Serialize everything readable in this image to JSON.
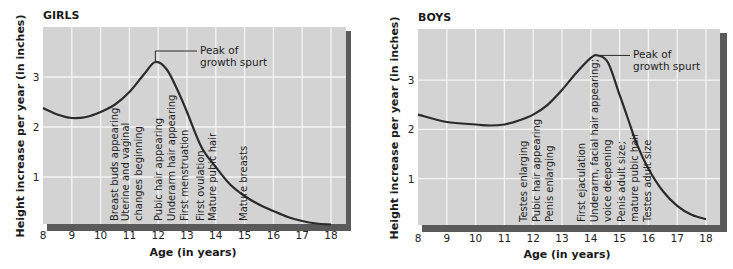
{
  "chart_data": [
    {
      "type": "line",
      "title": "GIRLS",
      "xlabel": "Age (in years)",
      "ylabel": "Height increase per year (in inches)",
      "xlim": [
        8,
        18
      ],
      "ylim": [
        0,
        3.9
      ],
      "xticks": [
        "8",
        "9",
        "10",
        "11",
        "12",
        "13",
        "14",
        "15",
        "16",
        "17",
        "18"
      ],
      "yticks": [
        "1",
        "2",
        "3"
      ],
      "grid": true,
      "x": [
        8,
        8.5,
        9,
        9.5,
        10,
        10.5,
        11,
        11.5,
        11.9,
        12.3,
        12.7,
        13,
        13.5,
        14,
        14.5,
        15,
        15.5,
        16,
        16.5,
        17,
        17.5,
        18
      ],
      "values": [
        2.38,
        2.25,
        2.18,
        2.2,
        2.3,
        2.45,
        2.7,
        3.05,
        3.3,
        3.15,
        2.7,
        2.3,
        1.6,
        1.2,
        0.85,
        0.62,
        0.45,
        0.32,
        0.2,
        0.12,
        0.07,
        0.05
      ],
      "annotations": {
        "peak": [
          "Peak of",
          "growth spurt"
        ],
        "peak_x": 11.9,
        "peak_y": 3.3,
        "events": [
          {
            "x": 10.45,
            "label": "Breast buds appearing"
          },
          {
            "x": 10.85,
            "label": "Uterine and vaginal"
          },
          {
            "x": 11.3,
            "label": "changes beginning"
          },
          {
            "x": 12.0,
            "label": "Pubic hair appearing"
          },
          {
            "x": 12.45,
            "label": "Underarm hair appearing"
          },
          {
            "x": 12.9,
            "label": "First menstruation"
          },
          {
            "x": 13.45,
            "label": "First ovulation"
          },
          {
            "x": 13.85,
            "label": "Mature pubic hair"
          },
          {
            "x": 14.95,
            "label": "Mature breasts"
          }
        ]
      }
    },
    {
      "type": "line",
      "title": "BOYS",
      "xlabel": "Age (in years)",
      "ylabel": "Height increase per year (in inches)",
      "xlim": [
        8,
        18
      ],
      "ylim": [
        0,
        3.9
      ],
      "xticks": [
        "8",
        "9",
        "10",
        "11",
        "12",
        "13",
        "14",
        "15",
        "16",
        "17",
        "18"
      ],
      "yticks": [
        "1",
        "2",
        "3"
      ],
      "grid": true,
      "x": [
        8,
        9,
        10,
        10.5,
        11,
        11.5,
        12,
        12.5,
        13,
        13.5,
        14,
        14.25,
        14.6,
        15,
        15.3,
        15.6,
        16,
        16.5,
        17,
        17.5,
        18
      ],
      "values": [
        2.3,
        2.15,
        2.1,
        2.08,
        2.1,
        2.18,
        2.3,
        2.5,
        2.8,
        3.15,
        3.45,
        3.5,
        3.35,
        2.7,
        2.2,
        1.7,
        1.2,
        0.75,
        0.45,
        0.27,
        0.18
      ],
      "annotations": {
        "peak": [
          "Peak of",
          "growth spurt"
        ],
        "peak_x": 14.25,
        "peak_y": 3.5,
        "events": [
          {
            "x": 11.65,
            "label": "Testes enlarging"
          },
          {
            "x": 12.1,
            "label": "Pubic hair appearing"
          },
          {
            "x": 12.55,
            "label": "Penis enlarging"
          },
          {
            "x": 13.65,
            "label": "First ejaculation"
          },
          {
            "x": 14.1,
            "label": "Underarm, facial hair appearing;"
          },
          {
            "x": 14.55,
            "label": "voice deepening"
          },
          {
            "x": 15.05,
            "label": "Penis adult size;"
          },
          {
            "x": 15.5,
            "label": "mature pubic hair"
          },
          {
            "x": 15.95,
            "label": "Testes adult size"
          }
        ]
      }
    }
  ],
  "girls": {
    "title": "GIRLS",
    "ylabel": "Height increase per year (in inches)",
    "xlabel": "Age (in years)",
    "peak_line1": "Peak of",
    "peak_line2": "growth spurt",
    "events": [
      "Breast buds appearing",
      "Uterine and vaginal",
      "changes beginning",
      "Pubic hair appearing",
      "Underarm hair appearing",
      "First menstruation",
      "First ovulation",
      "Mature pubic hair",
      "Mature breasts"
    ]
  },
  "boys": {
    "title": "BOYS",
    "ylabel": "Height increase per year (in inches)",
    "xlabel": "Age (in years)",
    "peak_line1": "Peak of",
    "peak_line2": "growth spurt",
    "events": [
      "Testes enlarging",
      "Pubic hair appearing",
      "Penis enlarging",
      "First ejaculation",
      "Underarm, facial hair appearing;",
      "voice deepening",
      "Penis adult size;",
      "mature pubic hair",
      "Testes adult size"
    ]
  },
  "colors": {
    "plot_bg": "#d3d3d3",
    "grid": "#f2f2f2",
    "shadow": "#555555",
    "curve": "#2b2b2b"
  }
}
